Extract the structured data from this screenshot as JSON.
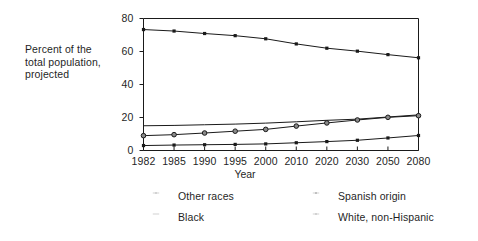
{
  "chart_data": {
    "type": "line",
    "title": "",
    "xlabel": "Year",
    "ylabel": "Percent of the\ntotal population,\nprojected",
    "categories": [
      "1982",
      "1985",
      "1990",
      "1995",
      "2000",
      "2010",
      "2020",
      "2030",
      "2050",
      "2080"
    ],
    "x": [
      1982,
      1985,
      1990,
      1995,
      2000,
      2010,
      2020,
      2030,
      2050,
      2080
    ],
    "ylim": [
      0,
      80
    ],
    "yticks": [
      0,
      20,
      40,
      60,
      80
    ],
    "ytick_labels": [
      "0",
      "20",
      "40",
      "60",
      "80"
    ],
    "grid": false,
    "legend_position": "below",
    "series": [
      {
        "name": "White, non-Hispanic",
        "marker": "dot",
        "values": [
          73.3,
          72.4,
          70.9,
          69.6,
          67.7,
          64.6,
          62.0,
          60.2,
          58.1,
          56.2
        ]
      },
      {
        "name": "Black",
        "marker": "none",
        "values": [
          15.0,
          15.2,
          15.6,
          16.0,
          16.6,
          17.4,
          18.3,
          19.0,
          20.3,
          21.6
        ]
      },
      {
        "name": "Spanish origin",
        "marker": "circle",
        "values": [
          9.0,
          9.6,
          10.6,
          11.7,
          12.8,
          14.8,
          16.7,
          18.5,
          20.1,
          21.1
        ]
      },
      {
        "name": "Other races",
        "marker": "dot",
        "values": [
          3.0,
          3.3,
          3.5,
          3.7,
          4.0,
          4.7,
          5.4,
          6.2,
          7.6,
          9.1
        ]
      }
    ]
  },
  "axis": {
    "caption": "Percent of the\ntotal population,\nprojected",
    "x_title": "Year",
    "y_tick_labels": [
      "80",
      "60",
      "40",
      "20",
      "0"
    ],
    "x_tick_labels": [
      "1982",
      "1985",
      "1990",
      "1995",
      "2000",
      "2010",
      "2020",
      "2030",
      "2050",
      "2080"
    ]
  },
  "legend": {
    "items": [
      {
        "label": "Other races",
        "marker": "dot"
      },
      {
        "label": "Spanish origin",
        "marker": "circle"
      },
      {
        "label": "Black",
        "marker": "none"
      },
      {
        "label": "White, non-Hispanic",
        "marker": "dot"
      }
    ]
  },
  "colors": {
    "line": "#1a1a1a",
    "text": "#1f1f1f",
    "background": "#ffffff"
  }
}
